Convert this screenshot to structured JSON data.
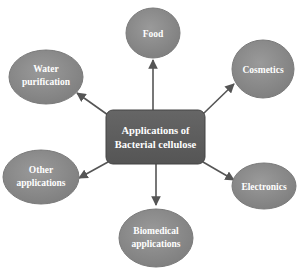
{
  "diagram": {
    "type": "mind-map",
    "center": {
      "lines": [
        "Applications of",
        "Bacterial cellulose"
      ],
      "fill": "#5c5c5c"
    },
    "node_fill": "#8c8c8c",
    "edge_color": "#555555",
    "nodes": [
      {
        "id": "food",
        "lines": [
          "Food"
        ]
      },
      {
        "id": "cosmetics",
        "lines": [
          "Cosmetics"
        ]
      },
      {
        "id": "electronics",
        "lines": [
          "Electronics"
        ]
      },
      {
        "id": "biomedical",
        "lines": [
          "Biomedical",
          "applications"
        ]
      },
      {
        "id": "other",
        "lines": [
          "Other",
          "applications"
        ]
      },
      {
        "id": "water",
        "lines": [
          "Water",
          "purification"
        ]
      }
    ]
  }
}
